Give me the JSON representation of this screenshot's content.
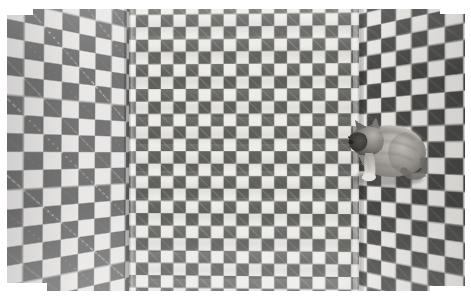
{
  "image": {
    "kind": "photograph",
    "title": "Grey tabby cat on a checkerboard-patterned cloth backdrop",
    "caption": "A grey tabby cat sits against a large black-and-white checkered fabric that is draped to form a three-sided corner, creating an optical-illusion background.",
    "medium": "black and white photographic print",
    "orientation": "landscape",
    "width_px": 471,
    "height_px": 301,
    "border": {
      "style": "white print margin",
      "color": "#ffffff",
      "top_px": 9,
      "right_px": 6,
      "bottom_px": 10,
      "left_px": 7
    },
    "palette": {
      "paper_white": "#ffffff",
      "checker_light": "#efeeeb",
      "checker_dark_left": "#6e6e6e",
      "checker_dark_middle": "#62625f",
      "checker_dark_right": "#4f4f4d",
      "cat_body_mid": "#9a9791",
      "cat_body_light": "#c9c6c0",
      "cat_face_dark": "#3b3a37",
      "cat_shadow": "#5d5b57"
    },
    "regions": [
      {
        "name": "left-panel",
        "label": "Left checkered panel",
        "description": "Checkered cloth receding to the left in steep perspective; squares appear widest here and the rows converge toward the central fold.",
        "square_size_px": 12,
        "dark_tone": "#6e6e6e"
      },
      {
        "name": "middle-panel",
        "label": "Central checkered panel",
        "description": "Flat front-facing expanse of the checkered cloth; fine vertical weave and gentle horizontal undulations are visible.",
        "square_size_px": 12,
        "dark_tone": "#62625f"
      },
      {
        "name": "right-panel",
        "label": "Right checkered panel",
        "description": "Checkered cloth angled away to the right; squares are compressed horizontally and the tone is darker and higher in contrast.",
        "square_size_px": 11,
        "dark_tone": "#4f4f4d"
      }
    ],
    "folds": [
      {
        "name": "left-fold",
        "label": "Left vertical crease",
        "x_px": 123,
        "description": "Shadowed vertical fold where the left panel meets the central panel."
      },
      {
        "name": "right-fold",
        "label": "Right vertical crease",
        "x_px": 351,
        "description": "Highlighted vertical fold where the central panel meets the right panel; the cat sits just to its right."
      }
    ],
    "subject": {
      "name": "cat",
      "label": "Cat",
      "species": "domestic cat",
      "coat": "grey tabby with dark face and paler flanks",
      "pose": "sitting, body in profile facing left, head turned toward the camera's left",
      "position": {
        "x_px": 328,
        "y_px": 100,
        "width_px": 92,
        "height_px": 78
      },
      "parts": [
        {
          "name": "head",
          "label": "Head"
        },
        {
          "name": "left-ear",
          "label": "Left ear"
        },
        {
          "name": "right-ear",
          "label": "Right ear"
        },
        {
          "name": "muzzle",
          "label": "Muzzle"
        },
        {
          "name": "body",
          "label": "Body"
        },
        {
          "name": "foreleg",
          "label": "Front leg"
        },
        {
          "name": "paw",
          "label": "Front paw"
        },
        {
          "name": "haunch",
          "label": "Haunch"
        },
        {
          "name": "tail",
          "label": "Tail"
        }
      ]
    }
  }
}
